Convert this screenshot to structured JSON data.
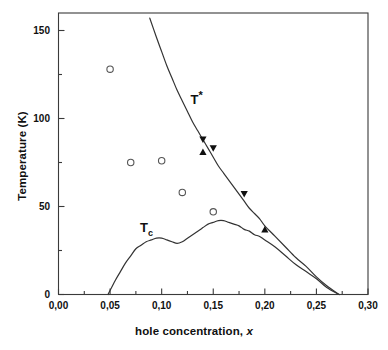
{
  "chart_data": {
    "type": "scatter",
    "title": "",
    "xlabel": "hole concentration, x",
    "ylabel": "Temperature (K)",
    "xlim": [
      0.0,
      0.3
    ],
    "ylim": [
      0,
      157
    ],
    "grid": false,
    "legend": null,
    "x_ticks": [
      "0,00",
      "0,05",
      "0,10",
      "0,15",
      "0,20",
      "0,25",
      "0,30"
    ],
    "x_tick_values": [
      0.0,
      0.05,
      0.1,
      0.15,
      0.2,
      0.25,
      0.3
    ],
    "x_minor_ticks": [
      0.025,
      0.075,
      0.125,
      0.175,
      0.225,
      0.275
    ],
    "y_ticks": [
      "0",
      "50",
      "100",
      "150"
    ],
    "y_tick_values": [
      0,
      50,
      100,
      150
    ],
    "y_minor_ticks": [
      25,
      75,
      125
    ],
    "annotations": [
      {
        "name": "t-star-label",
        "text": "T*",
        "x": 0.128,
        "y": 112
      },
      {
        "name": "tc-label",
        "text": "Tc",
        "x": 0.079,
        "y": 38
      }
    ],
    "series": [
      {
        "name": "T* pseudogap line",
        "type": "line",
        "marker": "none",
        "color": "#333333",
        "points": [
          [
            0.0885,
            157
          ],
          [
            0.095,
            146
          ],
          [
            0.1,
            138
          ],
          [
            0.105,
            130
          ],
          [
            0.11,
            123
          ],
          [
            0.115,
            116
          ],
          [
            0.12,
            110
          ],
          [
            0.125,
            104
          ],
          [
            0.13,
            98
          ],
          [
            0.135,
            93
          ],
          [
            0.14,
            88
          ],
          [
            0.145,
            83
          ],
          [
            0.15,
            78
          ],
          [
            0.155,
            73
          ],
          [
            0.16,
            69
          ],
          [
            0.165,
            65
          ],
          [
            0.17,
            61
          ],
          [
            0.175,
            57
          ],
          [
            0.18,
            53
          ],
          [
            0.185,
            49
          ],
          [
            0.19,
            46
          ],
          [
            0.195,
            43
          ],
          [
            0.2,
            39
          ],
          [
            0.21,
            33
          ],
          [
            0.22,
            27
          ],
          [
            0.23,
            21
          ],
          [
            0.24,
            16
          ],
          [
            0.25,
            10
          ],
          [
            0.26,
            5
          ],
          [
            0.272,
            0
          ]
        ]
      },
      {
        "name": "Tc superconducting dome",
        "type": "line",
        "marker": "none",
        "color": "#333333",
        "points": [
          [
            0.048,
            0
          ],
          [
            0.055,
            8
          ],
          [
            0.06,
            13
          ],
          [
            0.065,
            18
          ],
          [
            0.07,
            22
          ],
          [
            0.075,
            26
          ],
          [
            0.08,
            28
          ],
          [
            0.085,
            30
          ],
          [
            0.09,
            31
          ],
          [
            0.095,
            32
          ],
          [
            0.1,
            32
          ],
          [
            0.105,
            31
          ],
          [
            0.11,
            30
          ],
          [
            0.115,
            29
          ],
          [
            0.12,
            30
          ],
          [
            0.125,
            32
          ],
          [
            0.13,
            34
          ],
          [
            0.135,
            36
          ],
          [
            0.14,
            38
          ],
          [
            0.145,
            40
          ],
          [
            0.15,
            41
          ],
          [
            0.155,
            42
          ],
          [
            0.16,
            42
          ],
          [
            0.165,
            41
          ],
          [
            0.17,
            40
          ],
          [
            0.175,
            39
          ],
          [
            0.18,
            37
          ],
          [
            0.185,
            36
          ],
          [
            0.19,
            34
          ],
          [
            0.195,
            33
          ],
          [
            0.2,
            31
          ],
          [
            0.21,
            27
          ],
          [
            0.22,
            22
          ],
          [
            0.23,
            17
          ],
          [
            0.24,
            13
          ],
          [
            0.25,
            9
          ],
          [
            0.26,
            4
          ],
          [
            0.272,
            0
          ]
        ]
      },
      {
        "name": "open circles",
        "type": "scatter",
        "marker": "open-circle",
        "color": "#555555",
        "points": [
          [
            0.05,
            128
          ],
          [
            0.07,
            75
          ],
          [
            0.1,
            76
          ],
          [
            0.12,
            58
          ],
          [
            0.15,
            47
          ]
        ]
      },
      {
        "name": "filled down triangles",
        "type": "scatter",
        "marker": "filled-down-triangle",
        "color": "#101010",
        "points": [
          [
            0.14,
            88
          ],
          [
            0.15,
            83
          ],
          [
            0.18,
            57
          ]
        ]
      },
      {
        "name": "filled up triangles",
        "type": "scatter",
        "marker": "filled-up-triangle",
        "color": "#101010",
        "points": [
          [
            0.14,
            81
          ],
          [
            0.2,
            37
          ]
        ]
      }
    ]
  },
  "labels": {
    "y_axis_title": "Temperature (K)",
    "x_axis_title_main": "hole concentration, ",
    "x_axis_title_var": "x",
    "t_star": "T",
    "t_star_sup": "*",
    "tc_main": "T",
    "tc_sub": "c"
  }
}
